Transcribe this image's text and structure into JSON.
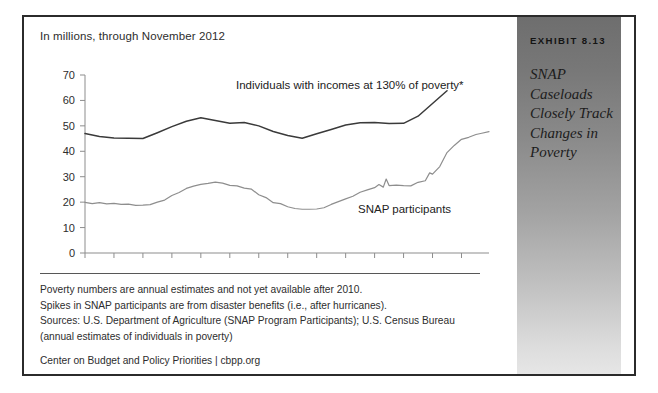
{
  "exhibit": {
    "number": "EXHIBIT 8.13",
    "title": "SNAP Caseloads Closely Track Changes in Poverty"
  },
  "chart": {
    "units_note": "In millions, through November 2012",
    "label_poverty": "Individuals with incomes at 130% of poverty*",
    "label_snap": "SNAP participants"
  },
  "footnotes": {
    "line1": "Poverty numbers are annual estimates and not yet available after 2010.",
    "line2": "Spikes in SNAP participants are from disaster benefits (i.e., after hurricanes).",
    "line3": "Sources: U.S. Department of Agriculture (SNAP Program Participants); U.S. Census Bureau (annual estimates of individuals in poverty)",
    "credit": "Center on Budget and Policy Priorities | cbpp.org"
  },
  "chart_data": {
    "type": "line",
    "title": "SNAP Caseloads Closely Track Changes in Poverty",
    "subtitle": "In millions, through November 2012",
    "xlabel": "",
    "ylabel": "",
    "ylim": [
      0,
      70
    ],
    "yticks": [
      0,
      10,
      20,
      30,
      40,
      50,
      60,
      70
    ],
    "xlim": [
      1985,
      2012.9
    ],
    "xticks": [
      1985,
      1987,
      1989,
      1991,
      1993,
      1995,
      1997,
      1999,
      2001,
      2003,
      2005,
      2007,
      2009,
      2011
    ],
    "xticklabels": [
      "'85",
      "'87",
      "'89",
      "'91",
      "'93",
      "'95",
      "'97",
      "'99",
      "'01",
      "'03",
      "'05",
      "'07",
      "'09",
      "'11"
    ],
    "grid": false,
    "legend": "inline-annotations",
    "series": [
      {
        "name": "Individuals with incomes at 130% of poverty*",
        "color": "#3a3a3a",
        "x": [
          1985,
          1986,
          1987,
          1988,
          1989,
          1990,
          1991,
          1992,
          1993,
          1994,
          1995,
          1996,
          1997,
          1998,
          1999,
          2000,
          2001,
          2002,
          2003,
          2004,
          2005,
          2006,
          2007,
          2008,
          2009,
          2010
        ],
        "values": [
          47.0,
          45.8,
          45.2,
          45.1,
          45.0,
          47.3,
          49.7,
          51.8,
          53.2,
          52.1,
          51.0,
          51.3,
          50.0,
          47.8,
          46.2,
          45.1,
          46.9,
          48.6,
          50.3,
          51.2,
          51.3,
          50.9,
          51.0,
          53.8,
          58.8,
          63.8
        ]
      },
      {
        "name": "SNAP participants",
        "color": "#8a8a8a",
        "x": [
          1985,
          1985.5,
          1986,
          1986.5,
          1987,
          1987.5,
          1988,
          1988.5,
          1989,
          1989.5,
          1990,
          1990.5,
          1991,
          1991.5,
          1992,
          1992.5,
          1993,
          1993.5,
          1994,
          1994.5,
          1995,
          1995.5,
          1996,
          1996.5,
          1997,
          1997.5,
          1998,
          1998.5,
          1999,
          1999.5,
          2000,
          2000.5,
          2001,
          2001.5,
          2002,
          2002.5,
          2003,
          2003.5,
          2004,
          2004.5,
          2005,
          2005.3,
          2005.6,
          2005.8,
          2006,
          2006.5,
          2007,
          2007.5,
          2008,
          2008.5,
          2008.8,
          2009,
          2009.5,
          2010,
          2010.5,
          2011,
          2011.5,
          2012,
          2012.4,
          2012.9
        ],
        "values": [
          19.9,
          19.4,
          19.8,
          19.3,
          19.5,
          19.1,
          19.2,
          18.7,
          18.8,
          19.0,
          20.0,
          20.8,
          22.6,
          23.8,
          25.4,
          26.3,
          27.0,
          27.4,
          27.9,
          27.5,
          26.6,
          26.4,
          25.5,
          25.1,
          22.9,
          21.8,
          19.8,
          19.4,
          18.2,
          17.5,
          17.2,
          17.2,
          17.3,
          17.8,
          19.1,
          20.2,
          21.3,
          22.3,
          23.9,
          24.8,
          25.7,
          26.9,
          25.9,
          29.1,
          26.5,
          26.7,
          26.5,
          26.4,
          27.8,
          28.4,
          31.5,
          31.0,
          34.0,
          39.5,
          42.3,
          44.7,
          45.5,
          46.6,
          47.1,
          47.7
        ]
      }
    ],
    "annotations": [
      {
        "text": "Individuals with incomes at 130% of poverty*",
        "near_series": "poverty"
      },
      {
        "text": "SNAP participants",
        "near_series": "snap"
      }
    ]
  }
}
